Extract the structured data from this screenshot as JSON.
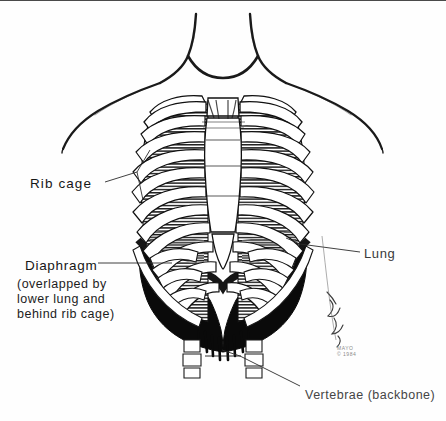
{
  "figure": {
    "view": "anterior (front) view of human thorax",
    "style": "black and white pen-and-ink medical illustration",
    "background_color": "#fefefe",
    "ink_color": "#111111"
  },
  "labels": {
    "rib_cage": "Rib cage",
    "diaphragm": "Diaphragm",
    "diaphragm_note": "(overlapped by\nlower lung and\nbehind rib cage)",
    "lung": "Lung",
    "vertebrae": "Vertebrae (backbone)"
  },
  "credit": {
    "text": "MAYO\n© 1984",
    "signature": "artist signature"
  },
  "structures": [
    {
      "name": "neck-and-shoulder-outline",
      "fill": "none",
      "stroke": "#1a1a1a"
    },
    {
      "name": "clavicle-left",
      "fill": "#ffffff",
      "stroke": "#111111"
    },
    {
      "name": "clavicle-right",
      "fill": "#ffffff",
      "stroke": "#111111"
    },
    {
      "name": "sternum",
      "fill": "#ffffff",
      "stroke": "#111111"
    },
    {
      "name": "rib-pairs",
      "count": 10,
      "fill": "#ffffff",
      "stroke": "#111111"
    },
    {
      "name": "lung-left",
      "fill": "hatched",
      "stroke": "#111111"
    },
    {
      "name": "lung-right",
      "fill": "hatched",
      "stroke": "#111111"
    },
    {
      "name": "diaphragm",
      "fill": "#000000",
      "stroke": "#000000"
    },
    {
      "name": "vertebrae-column",
      "fill": "#ffffff",
      "stroke": "#111111"
    }
  ],
  "colors": {
    "ink": "#111111",
    "diaphragm_fill": "#000000",
    "bone_fill": "#ffffff",
    "label_text": "#161616",
    "faint_text": "#8a8a8a"
  }
}
